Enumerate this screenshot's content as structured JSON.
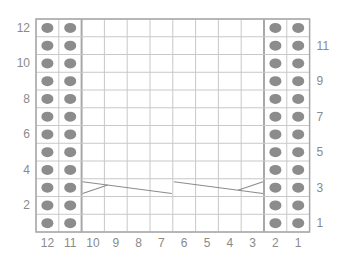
{
  "chart": {
    "columns": 12,
    "rows": 12,
    "column_labels": [
      "12",
      "11",
      "10",
      "9",
      "8",
      "7",
      "6",
      "5",
      "4",
      "3",
      "2",
      "1"
    ],
    "left_row_labels": [
      "12",
      "10",
      "8",
      "6",
      "4",
      "2"
    ],
    "right_row_labels": [
      "11",
      "9",
      "7",
      "5",
      "3",
      "1"
    ],
    "purl_columns": [
      12,
      11,
      2,
      1
    ],
    "symbols": {
      "dot": "purl-stitch",
      "empty": "knit-stitch",
      "cable_lines": "cable-cross"
    },
    "cables": [
      {
        "row": 3,
        "from_col": 10,
        "to_col": 7,
        "name": "left-cable"
      },
      {
        "row": 3,
        "from_col": 6,
        "to_col": 3,
        "name": "right-cable"
      }
    ],
    "colors": {
      "grid": "#c8c8c8",
      "divider": "#a8a8a8",
      "dot": "#8c8c8c",
      "label": "#8a8a8a",
      "cable": "#8c8c8c"
    }
  }
}
